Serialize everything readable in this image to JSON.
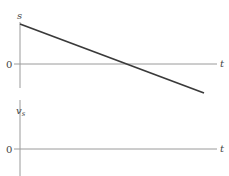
{
  "colors": {
    "axis": "#9a9a9a",
    "curve": "#3a3a3a",
    "text": "#444444",
    "background": "#ffffff"
  },
  "top_graph": {
    "y_label": "s",
    "x_label": "t",
    "origin_label": "0",
    "curve": {
      "type": "line",
      "description": "straight line with negative slope, starting positive at t=0 and crossing zero",
      "start": [
        20,
        24
      ],
      "end": [
        204,
        93
      ]
    }
  },
  "bottom_graph": {
    "y_label_main": "v",
    "y_label_sub": "s",
    "x_label": "t",
    "origin_label": "0",
    "curve": null
  }
}
